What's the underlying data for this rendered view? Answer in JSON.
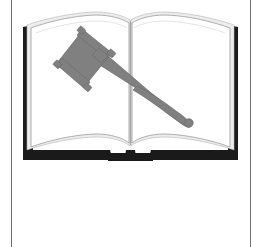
{
  "page": {
    "width": 262,
    "height": 247,
    "background_color": "#ffffff",
    "title": "Gavel on Open Book"
  },
  "frame": {
    "rule_left_x": 11,
    "rule_right_x": 250,
    "rule_color": "#6f6f6f",
    "rule_width": 1,
    "has_top_rule": false,
    "has_bottom_rule": false
  },
  "illustration": {
    "name": "gavel-on-open-book",
    "description": "Line-art clip art of a judge's gavel lying diagonally across an open book",
    "colors": {
      "book_cover": "#1a1a1a",
      "page_white": "#ffffff",
      "page_shadow": "#ededed",
      "page_outline": "#9a9a9a",
      "gavel_gray": "#808080",
      "gavel_outline": "#6b6b6b"
    },
    "parts": [
      {
        "label": "book-cover",
        "description": "dark outer cover seen behind and below the pages"
      },
      {
        "label": "left-page",
        "description": "left open page with curved top and bottom edges"
      },
      {
        "label": "right-page",
        "description": "right open page with curved top and bottom edges"
      },
      {
        "label": "book-spine-notch",
        "description": "small tab notch at bottom center of the cover"
      },
      {
        "label": "gavel-head",
        "description": "rotated rectangular mallet head with banded ends, upper left"
      },
      {
        "label": "gavel-handle",
        "description": "tapered handle running down to the lower right"
      },
      {
        "label": "gavel-handle-knob",
        "description": "small rounded knob at the handle tip"
      }
    ]
  },
  "text": {
    "caption": "",
    "labels": []
  }
}
